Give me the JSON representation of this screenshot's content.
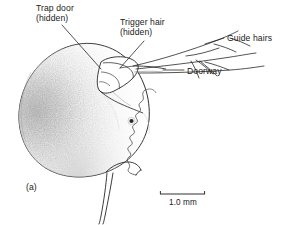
{
  "figure": {
    "panel_label": "(a)",
    "background_color": "#ffffff",
    "ink_color": "#1a1a1a"
  },
  "annotations": [
    {
      "id": "trap-door",
      "line1": "Trap door",
      "line2": "(hidden)",
      "leader": "diagonal-down-right"
    },
    {
      "id": "trigger-hair",
      "line1": "Trigger hair",
      "line2": "(hidden)",
      "leader": "diagonal-down-left"
    },
    {
      "id": "guide-hairs",
      "line1": "Guide hairs",
      "line2": "",
      "leader": "horizontal-left"
    },
    {
      "id": "doorway",
      "line1": "Doorway",
      "line2": "",
      "leader": "horizontal-left"
    }
  ],
  "scale_bar": {
    "label": "1.0 mm",
    "length_px": 45,
    "value": 1.0,
    "unit": "mm"
  }
}
